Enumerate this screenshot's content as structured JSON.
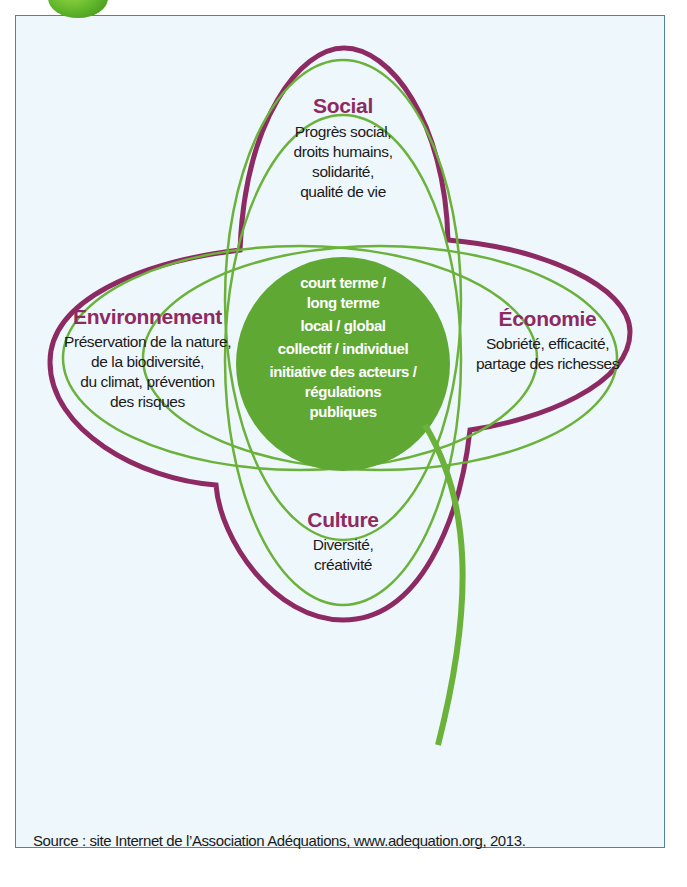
{
  "colors": {
    "outline_purple": "#8e2a63",
    "leaf_green": "#6ab23a",
    "center_fill": "#5fa833",
    "frame_border": "#4a82b4",
    "frame_background": "#eef7fb"
  },
  "diagram": {
    "petals": [
      {
        "id": "social",
        "title": "Social",
        "lines": [
          "Progrès social,",
          "droits humains,",
          "solidarité,",
          "qualité de vie"
        ]
      },
      {
        "id": "environnement",
        "title": "Environnement",
        "lines": [
          "Préservation de la nature,",
          "de la biodiversité,",
          "du climat, prévention",
          "des risques"
        ]
      },
      {
        "id": "economie",
        "title": "Économie",
        "lines": [
          "Sobriété, efficacité,",
          "partage des richesses"
        ]
      },
      {
        "id": "culture",
        "title": "Culture",
        "lines": [
          "Diversité,",
          "créativité"
        ]
      }
    ],
    "center": {
      "items": [
        "court terme /",
        "long terme",
        "local / global",
        "collectif / individuel",
        "initiative des acteurs /",
        "régulations",
        "publiques"
      ]
    }
  },
  "footer": {
    "source": "Source : site Internet de l’Association Adéquations, www.adequation.org, 2013."
  }
}
